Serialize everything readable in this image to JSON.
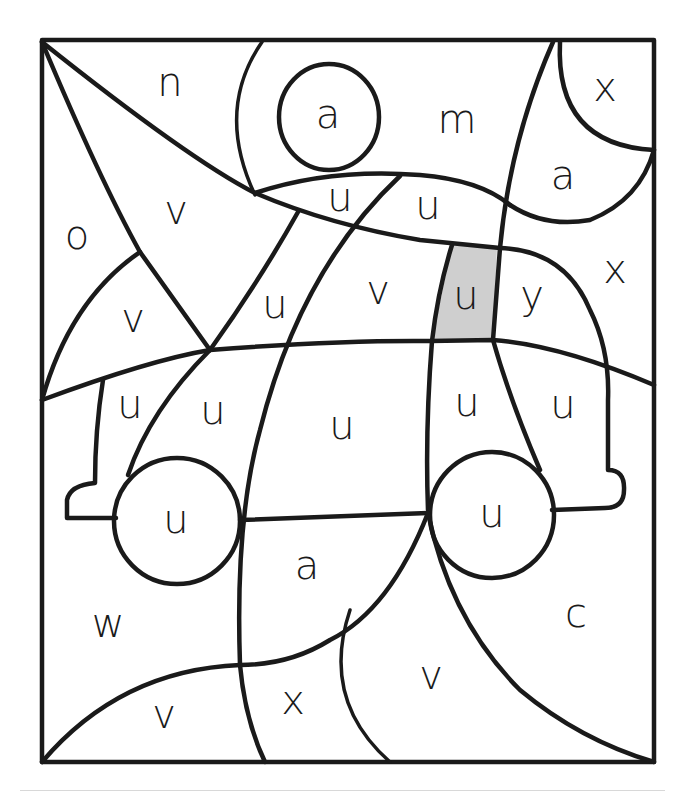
{
  "worksheet": {
    "type": "color-by-letter puzzle",
    "hidden_picture": "car",
    "colors": {
      "line": "#1a1a1a",
      "filled_region": "#cfcfcf",
      "background": "#ffffff"
    },
    "frame": {
      "x": 42,
      "y": 40,
      "width": 612,
      "height": 722
    },
    "labels": [
      {
        "id": "r1",
        "letter": "n",
        "x": 170,
        "y": 85
      },
      {
        "id": "r2",
        "letter": "a",
        "x": 328,
        "y": 117
      },
      {
        "id": "r3",
        "letter": "m",
        "x": 457,
        "y": 122
      },
      {
        "id": "r4",
        "letter": "x",
        "x": 605,
        "y": 90
      },
      {
        "id": "r5",
        "letter": "a",
        "x": 563,
        "y": 178
      },
      {
        "id": "r6",
        "letter": "u",
        "x": 340,
        "y": 200
      },
      {
        "id": "r7",
        "letter": "u",
        "x": 428,
        "y": 208
      },
      {
        "id": "r8",
        "letter": "v",
        "x": 176,
        "y": 213
      },
      {
        "id": "r9",
        "letter": "o",
        "x": 77,
        "y": 238
      },
      {
        "id": "r10",
        "letter": "x",
        "x": 615,
        "y": 272
      },
      {
        "id": "r11",
        "letter": "v",
        "x": 378,
        "y": 293
      },
      {
        "id": "r12",
        "letter": "u",
        "x": 466,
        "y": 298,
        "filled": true
      },
      {
        "id": "r13",
        "letter": "y",
        "x": 532,
        "y": 298
      },
      {
        "id": "r14",
        "letter": "u",
        "x": 275,
        "y": 307
      },
      {
        "id": "r15",
        "letter": "v",
        "x": 133,
        "y": 321
      },
      {
        "id": "r16",
        "letter": "u",
        "x": 130,
        "y": 407
      },
      {
        "id": "r17",
        "letter": "u",
        "x": 213,
        "y": 413
      },
      {
        "id": "r18",
        "letter": "u",
        "x": 342,
        "y": 428
      },
      {
        "id": "r19",
        "letter": "u",
        "x": 467,
        "y": 405
      },
      {
        "id": "r20",
        "letter": "u",
        "x": 563,
        "y": 407
      },
      {
        "id": "r21",
        "letter": "u",
        "x": 176,
        "y": 522
      },
      {
        "id": "r22",
        "letter": "u",
        "x": 492,
        "y": 516
      },
      {
        "id": "r23",
        "letter": "a",
        "x": 307,
        "y": 568
      },
      {
        "id": "r24",
        "letter": "w",
        "x": 108,
        "y": 626
      },
      {
        "id": "r25",
        "letter": "c",
        "x": 576,
        "y": 616
      },
      {
        "id": "r26",
        "letter": "v",
        "x": 431,
        "y": 678
      },
      {
        "id": "r27",
        "letter": "x",
        "x": 293,
        "y": 703
      },
      {
        "id": "r28",
        "letter": "v",
        "x": 164,
        "y": 717
      }
    ]
  }
}
